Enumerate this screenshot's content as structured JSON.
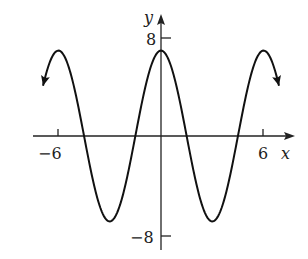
{
  "chart_data": {
    "type": "line",
    "title": "",
    "xlabel": "x",
    "ylabel": "y",
    "x_ticks": [
      {
        "value": -6,
        "label": "−6"
      },
      {
        "value": 6,
        "label": "6"
      }
    ],
    "y_ticks": [
      {
        "value": 8,
        "label": "8"
      },
      {
        "value": -8,
        "label": "−8"
      }
    ],
    "xlim": [
      -6.5,
      7
    ],
    "ylim": [
      -8.5,
      9
    ],
    "grid": false,
    "series": [
      {
        "name": "y = 7cos(πx/3)",
        "amplitude": 7,
        "period": 6,
        "x_range": [
          -6.9,
          6.9
        ],
        "arrows_at_ends": true,
        "key_points": [
          {
            "x": -6,
            "y": 7
          },
          {
            "x": -4.5,
            "y": 0
          },
          {
            "x": -3,
            "y": -7
          },
          {
            "x": -1.5,
            "y": 0
          },
          {
            "x": 0,
            "y": 7
          },
          {
            "x": 1.5,
            "y": 0
          },
          {
            "x": 3,
            "y": -7
          },
          {
            "x": 4.5,
            "y": 0
          },
          {
            "x": 6,
            "y": 7
          }
        ]
      }
    ]
  },
  "labels": {
    "x_axis": "x",
    "y_axis": "y",
    "tick_x_neg": "−6",
    "tick_x_pos": "6",
    "tick_y_pos": "8",
    "tick_y_neg": "−8"
  }
}
